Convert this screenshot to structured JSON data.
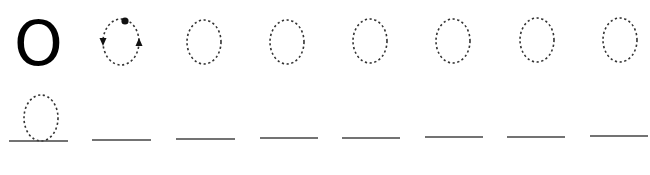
{
  "worksheet": {
    "model_letter": "O",
    "stroke_color": "#333333",
    "line_color": "#444444",
    "row1": {
      "demo_trace": {
        "cx": 121,
        "cy": 42,
        "rx": 18,
        "ry": 23,
        "start_dot": {
          "x": 125,
          "y": 21
        },
        "arrows": [
          "down-left",
          "up-right"
        ]
      },
      "trace_ovals": [
        {
          "cx": 204,
          "cy": 42,
          "rx": 17,
          "ry": 22
        },
        {
          "cx": 287,
          "cy": 42,
          "rx": 17,
          "ry": 22
        },
        {
          "cx": 370,
          "cy": 41,
          "rx": 17,
          "ry": 22
        },
        {
          "cx": 453,
          "cy": 41,
          "rx": 17,
          "ry": 22
        },
        {
          "cx": 537,
          "cy": 40,
          "rx": 17,
          "ry": 22
        },
        {
          "cx": 620,
          "cy": 40,
          "rx": 17,
          "ry": 22
        }
      ]
    },
    "row2": {
      "trace_oval": {
        "cx": 41,
        "cy": 118,
        "rx": 17,
        "ry": 23
      },
      "writing_lines": [
        {
          "x1": 9,
          "x2": 68,
          "y": 141
        },
        {
          "x1": 92,
          "x2": 151,
          "y": 140
        },
        {
          "x1": 176,
          "x2": 235,
          "y": 139
        },
        {
          "x1": 260,
          "x2": 318,
          "y": 138
        },
        {
          "x1": 342,
          "x2": 400,
          "y": 138
        },
        {
          "x1": 425,
          "x2": 483,
          "y": 137
        },
        {
          "x1": 507,
          "x2": 565,
          "y": 137
        },
        {
          "x1": 590,
          "x2": 648,
          "y": 136
        }
      ]
    }
  }
}
